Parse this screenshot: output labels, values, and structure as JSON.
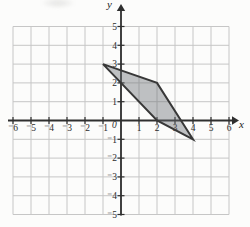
{
  "figure": {
    "background": "#fcfcfb",
    "grid_color": "#c6c6c6",
    "axis_color": "#2f2f2f",
    "tick_label_color": "#2b2b2b",
    "polygon_fill": "rgba(104,109,114,0.42)",
    "polygon_stroke": "#383838"
  },
  "chart_data": {
    "type": "area",
    "title": "",
    "xlabel": "x",
    "ylabel": "y",
    "origin_label": "0",
    "xlim": [
      -6,
      6
    ],
    "ylim": [
      -5,
      5
    ],
    "grid": true,
    "x_ticks": [
      {
        "v": -6,
        "label": "⁻6"
      },
      {
        "v": -5,
        "label": "⁻5"
      },
      {
        "v": -4,
        "label": "⁻4"
      },
      {
        "v": -3,
        "label": "⁻3"
      },
      {
        "v": -2,
        "label": "⁻2"
      },
      {
        "v": -1,
        "label": "⁻1"
      },
      {
        "v": 1,
        "label": "1"
      },
      {
        "v": 2,
        "label": "2"
      },
      {
        "v": 3,
        "label": "3"
      },
      {
        "v": 4,
        "label": "4"
      },
      {
        "v": 5,
        "label": "5"
      },
      {
        "v": 6,
        "label": "6"
      }
    ],
    "y_ticks": [
      {
        "v": 5,
        "label": "5"
      },
      {
        "v": 4,
        "label": "4"
      },
      {
        "v": 3,
        "label": "3"
      },
      {
        "v": 2,
        "label": "2"
      },
      {
        "v": 1,
        "label": "1"
      },
      {
        "v": -1,
        "label": "⁻1"
      },
      {
        "v": -2,
        "label": "⁻2"
      },
      {
        "v": -3,
        "label": "⁻3"
      },
      {
        "v": -4,
        "label": "⁻4"
      },
      {
        "v": -5,
        "label": "⁻5"
      }
    ],
    "series": [
      {
        "name": "shaded-quadrilateral",
        "vertices": [
          [
            -1,
            3
          ],
          [
            2,
            2
          ],
          [
            4,
            -1
          ],
          [
            2,
            0
          ]
        ]
      }
    ]
  }
}
